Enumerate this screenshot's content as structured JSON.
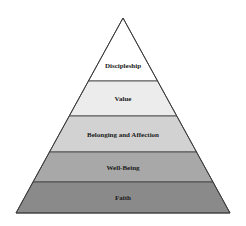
{
  "diagram": {
    "type": "pyramid",
    "apex": [
      123,
      18
    ],
    "base_left_x": 16,
    "base_right_x": 230,
    "base_y": 213,
    "outline_color": "#3a3a3a",
    "layers": [
      {
        "label": "Discipleship",
        "top_y": 18,
        "bottom_y": 81,
        "fill": "#ffffff",
        "label_y": 68
      },
      {
        "label": "Value",
        "top_y": 81,
        "bottom_y": 116,
        "fill": "#ececec",
        "label_y": 101
      },
      {
        "label": "Belonging and Affection",
        "top_y": 116,
        "bottom_y": 152,
        "fill": "#d2d2d2",
        "label_y": 137
      },
      {
        "label": "Well-Being",
        "top_y": 152,
        "bottom_y": 182,
        "fill": "#a8a8a8",
        "label_y": 170
      },
      {
        "label": "Faith",
        "top_y": 182,
        "bottom_y": 213,
        "fill": "#8a8a8a",
        "label_y": 200
      }
    ]
  }
}
